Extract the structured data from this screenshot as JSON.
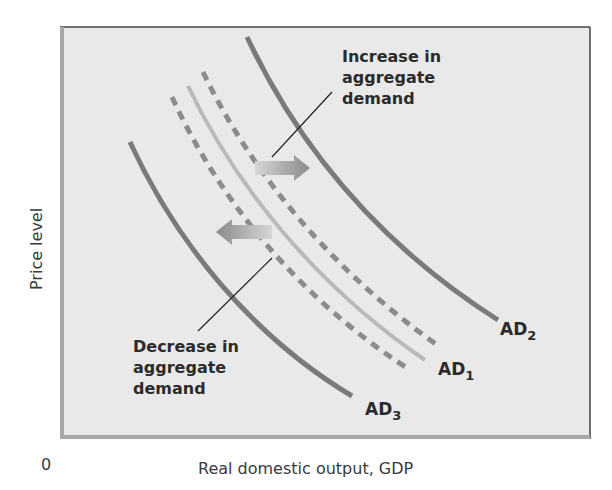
{
  "chart_data": {
    "type": "line",
    "title": "",
    "xlabel": "Real domestic output, GDP",
    "ylabel": "Price level",
    "origin_label": "0",
    "grid": false,
    "legend": "none (curves labeled directly)",
    "axis_ticks": "none",
    "series": [
      {
        "name": "AD2",
        "label_main": "AD",
        "label_sub": "2",
        "style": "solid",
        "color": "#7a7a7a",
        "width": 5,
        "points": [
          [
            247,
            37
          ],
          [
            300,
            150
          ],
          [
            380,
            245
          ],
          [
            498,
            320
          ]
        ],
        "label_pos": [
          500,
          335
        ]
      },
      {
        "name": "AD increase (dashed)",
        "style": "dashed",
        "color": "#8c8c8c",
        "width": 5,
        "points": [
          [
            203,
            72
          ],
          [
            250,
            170
          ],
          [
            330,
            270
          ],
          [
            440,
            347
          ]
        ]
      },
      {
        "name": "AD1",
        "label_main": "AD",
        "label_sub": "1",
        "style": "solid-light",
        "color": "#b9b9b9",
        "width": 4,
        "points": [
          [
            188,
            86
          ],
          [
            235,
            185
          ],
          [
            315,
            285
          ],
          [
            425,
            360
          ]
        ],
        "label_pos": [
          438,
          375
        ]
      },
      {
        "name": "AD decrease (dashed)",
        "style": "dashed",
        "color": "#8c8c8c",
        "width": 5,
        "points": [
          [
            172,
            97
          ],
          [
            218,
            198
          ],
          [
            298,
            298
          ],
          [
            410,
            370
          ]
        ]
      },
      {
        "name": "AD3",
        "label_main": "AD",
        "label_sub": "3",
        "style": "solid",
        "color": "#7a7a7a",
        "width": 5,
        "points": [
          [
            130,
            142
          ],
          [
            175,
            240
          ],
          [
            250,
            335
          ],
          [
            352,
            396
          ]
        ],
        "label_pos": [
          365,
          415
        ]
      }
    ],
    "annotations": [
      {
        "lines": [
          "Increase in",
          "aggregate",
          "demand"
        ],
        "x": 342,
        "y": 62,
        "pointer": [
          [
            332,
            92
          ],
          [
            272,
            157
          ]
        ],
        "arrow": {
          "direction": "right",
          "from": [
            255,
            168
          ],
          "to": [
            310,
            168
          ]
        }
      },
      {
        "lines": [
          "Decrease in",
          "aggregate",
          "demand"
        ],
        "x": 133,
        "y": 352,
        "pointer": [
          [
            198,
            331
          ],
          [
            272,
            258
          ]
        ],
        "arrow": {
          "direction": "left",
          "from": [
            272,
            232
          ],
          "to": [
            216,
            232
          ]
        }
      }
    ]
  },
  "frame": {
    "x": 60,
    "y": 27,
    "width": 530,
    "height": 412,
    "fill": "#e9e9e9",
    "border_dark": "#444444",
    "border_light": "#a8a8a8"
  },
  "labels": {
    "y_axis": "Price level",
    "x_axis": "Real domestic output, GDP",
    "origin": "0",
    "increase": [
      "Increase in",
      "aggregate",
      "demand"
    ],
    "decrease": [
      "Decrease in",
      "aggregate",
      "demand"
    ],
    "ad1": {
      "main": "AD",
      "sub": "1"
    },
    "ad2": {
      "main": "AD",
      "sub": "2"
    },
    "ad3": {
      "main": "AD",
      "sub": "3"
    }
  }
}
